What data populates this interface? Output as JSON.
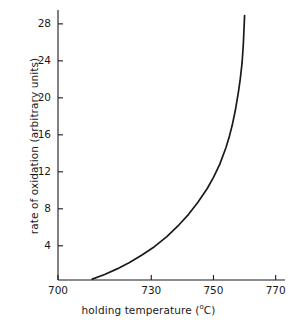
{
  "chart_data": {
    "type": "line",
    "title": "",
    "xlabel": "holding temperature (°C)",
    "xlabel_text": "holding temperature (",
    "xlabel_sup": "o",
    "xlabel_tail": "C)",
    "ylabel": "rate of oxidation (arbitrary units)",
    "xlim": [
      700,
      773
    ],
    "ylim": [
      0.3,
      29.5
    ],
    "grid": false,
    "legend": null,
    "xticks": [
      700,
      730,
      750,
      770
    ],
    "xtick_labels": [
      "700",
      "730",
      "750",
      "770"
    ],
    "yticks": [
      4,
      8,
      12,
      16,
      20,
      24,
      28
    ],
    "ytick_labels": [
      "4",
      "8",
      "12",
      "16",
      "20",
      "24",
      "28"
    ],
    "line_color": "#1a1a1a",
    "axis_color": "#1a1a1a",
    "series": [
      {
        "name": "rate of oxidation",
        "x": [
          711,
          715,
          719,
          723,
          727,
          731,
          735,
          739,
          742,
          745,
          748,
          750,
          752,
          754,
          755,
          756,
          757,
          758,
          758.6,
          759.2,
          759.6,
          760
        ],
        "y": [
          0.4,
          0.9,
          1.5,
          2.2,
          3.0,
          3.9,
          5.0,
          6.3,
          7.4,
          8.7,
          10.2,
          11.4,
          12.8,
          14.6,
          15.7,
          17.0,
          18.6,
          20.6,
          22.0,
          23.8,
          25.8,
          28.9
        ]
      }
    ]
  }
}
